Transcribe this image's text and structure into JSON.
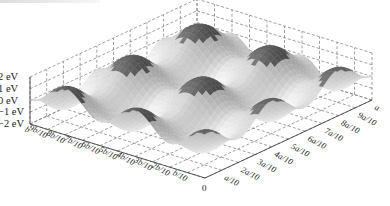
{
  "figure": {
    "caption_visible": ""
  },
  "chart_data": {
    "type": "surface3d",
    "title": "",
    "function_hint": "periodic 2D potential, ~5 maxima per lattice period along each axis",
    "x_axis": {
      "name": "a",
      "ticks": [
        "0",
        "a/10",
        "2a/10",
        "3a/10",
        "4a/10",
        "5a/10",
        "6a/10",
        "7a/10",
        "8a/10",
        "9a/10",
        "a"
      ]
    },
    "y_axis": {
      "name": "b",
      "ticks": [
        "0",
        "b/10",
        "2b/10",
        "3b/10",
        "4b/10",
        "5b/10",
        "6b/10",
        "7b/10",
        "8b/10",
        "9b/10",
        "b"
      ]
    },
    "z_axis": {
      "label": "eV",
      "ticks": [
        "2 eV",
        "1 eV",
        "0 eV",
        "−1 eV",
        "−2 eV"
      ],
      "values": [
        2,
        1,
        0,
        -1,
        -2
      ],
      "range": [
        -2,
        2
      ]
    },
    "periods_x": 2.5,
    "periods_y": 2.5,
    "amplitude_eV": 2,
    "colormap": "grayscale (dark peaks/slopes, light valleys)",
    "grid": "dashed on back panes and base plane"
  }
}
